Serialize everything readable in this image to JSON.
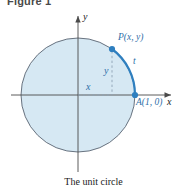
{
  "figure": {
    "title": "Figure 1",
    "caption": "The unit circle"
  },
  "axes": {
    "x_label": "x",
    "y_label": "y"
  },
  "labels": {
    "point_p": "P(x, y)",
    "point_a": "A(1, 0)",
    "arc_t": "t",
    "coord_x": "x",
    "coord_y": "y"
  },
  "colors": {
    "circle_fill": "#d6e8f3",
    "circle_stroke": "#5a6472",
    "arc": "#2f7fbf",
    "point": "#2f7fbf",
    "axis": "#4a4a4a",
    "dashed": "#8fa3b5",
    "label_blue": "#2f6fa8",
    "title": "#4a4a4a"
  },
  "geometry": {
    "center_x": 78,
    "center_y": 95,
    "radius": 57,
    "point_p_x": 112,
    "point_p_y": 49,
    "point_a_x": 135,
    "point_a_y": 95
  }
}
